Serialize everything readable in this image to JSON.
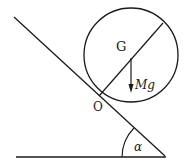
{
  "diagram": {
    "labels": {
      "center": "G",
      "contact_point": "O",
      "force": "Mg",
      "angle": "α"
    },
    "colors": {
      "stroke": "#1a1a1a",
      "background": "#ffffff"
    }
  }
}
